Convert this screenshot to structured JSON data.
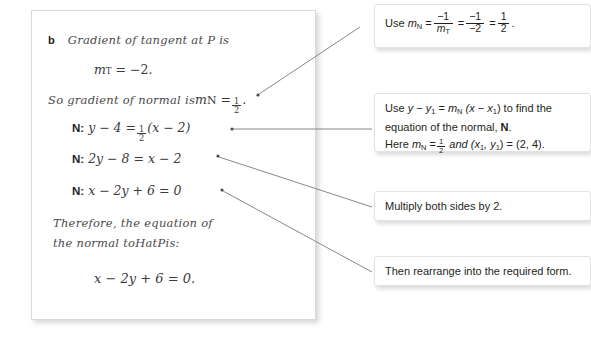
{
  "solution": {
    "step_letter": "b",
    "line_1": "Gradient of tangent at P is",
    "line_2_lhs": "m",
    "line_2_sub": "T",
    "line_2_rhs": "= −2.",
    "line_3_pre": "So gradient of normal is ",
    "line_3_m": "m",
    "line_3_sub": "N",
    "line_3_eq": "=",
    "line_3_num": "1",
    "line_3_den": "2",
    "line_3_post": ".",
    "eq_1_label": "N:",
    "eq_1_pre": "y − 4 =",
    "eq_1_num": "1",
    "eq_1_den": "2",
    "eq_1_post": "(x − 2)",
    "eq_2_label": "N:",
    "eq_2_body": "2y − 8 = x − 2",
    "eq_3_label": "N:",
    "eq_3_body": "x − 2y + 6 = 0",
    "concl_line_1": "Therefore, the equation of",
    "concl_line_2_a": "the normal to ",
    "concl_line_2_h": "H",
    "concl_line_2_b": " at ",
    "concl_line_2_p": "P",
    "concl_line_2_c": " is:",
    "final_answer": "x − 2y + 6 = 0."
  },
  "callouts": [
    {
      "id": "callout-1",
      "name": "callout-gradient-of-normal",
      "prefix": "Use ",
      "m_var": "m",
      "m_sub": "N",
      "eq1": "=",
      "f1_num": "−1",
      "f1_den_var": "m",
      "f1_den_sub": "T",
      "eq2": "=",
      "f2_num": "−1",
      "f2_den": "−2",
      "eq3": "=",
      "f3_num": "1",
      "f3_den": "2",
      "suffix": "."
    },
    {
      "id": "callout-2",
      "name": "callout-point-slope-form",
      "line1_a": "Use ",
      "line1_y": "y",
      "line1_minus": " − ",
      "line1_y1": "y",
      "line1_y1sub": "1",
      "line1_eq": " = ",
      "line1_m": "m",
      "line1_msub": "N",
      "line1_brack": " (x − x",
      "line1_xsub": "1",
      "line1_end": ") to find the",
      "line2_a": "equation of the normal, ",
      "line2_bold": "N",
      "line2_b": ".",
      "line3_a": "Here ",
      "line3_m": "m",
      "line3_msub": "N",
      "line3_eq": "=",
      "line3_num": "1",
      "line3_den": "2",
      "line3_b": " and (x",
      "line3_xsub": "1",
      "line3_c": ", y",
      "line3_ysub": "1",
      "line3_d": ") = (2, 4)."
    },
    {
      "id": "callout-3",
      "name": "callout-multiply-both-sides",
      "text": "Multiply both sides by 2."
    },
    {
      "id": "callout-4",
      "name": "callout-rearrange",
      "text": "Then rearrange into the required form."
    }
  ],
  "colors": {
    "page_background": "#ffffff",
    "panel_border": "#d9d9d9",
    "callout_border": "#e2e2e2",
    "text": "#231f20",
    "hand_text": "#4a4a4a",
    "connector_line": "#6e6e6e"
  },
  "connectors": [
    {
      "name": "connector-gradient-of-normal",
      "from_x": 258,
      "from_y": 95,
      "to_x": 360,
      "to_y": 28
    },
    {
      "name": "connector-point-slope-form",
      "from_x": 231,
      "from_y": 129,
      "to_x": 368,
      "to_y": 129
    },
    {
      "name": "connector-multiply",
      "from_x": 217,
      "from_y": 156,
      "to_x": 368,
      "to_y": 206
    },
    {
      "name": "connector-rearrange",
      "from_x": 221,
      "from_y": 191,
      "to_x": 368,
      "to_y": 271
    }
  ]
}
